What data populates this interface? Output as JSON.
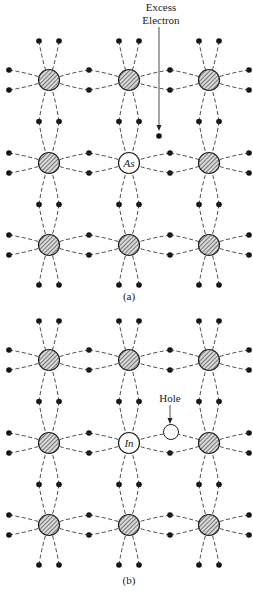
{
  "diagram": {
    "panels": [
      {
        "id": "a",
        "caption": "(a)",
        "impurity_label": "As",
        "annotation": "Excess Electron",
        "annotation_lines": [
          "Excess",
          "Electron"
        ],
        "rows_y": [
          80,
          163,
          245
        ],
        "cols_x": [
          49,
          129,
          209
        ],
        "impurity_cell": [
          1,
          1
        ]
      },
      {
        "id": "b",
        "caption": "(b)",
        "impurity_label": "In",
        "annotation": "Hole",
        "annotation_lines": [
          "Hole"
        ],
        "rows_y": [
          360,
          443,
          525
        ],
        "cols_x": [
          49,
          129,
          209
        ],
        "impurity_cell": [
          1,
          1
        ]
      }
    ],
    "colors": {
      "ink": "#222222",
      "background": "#ffffff"
    }
  }
}
